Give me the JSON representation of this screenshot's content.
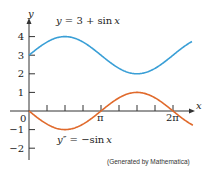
{
  "chart_data": {
    "type": "line",
    "title": "",
    "xlabel": "x",
    "ylabel": "y",
    "xlim": [
      0,
      7.11
    ],
    "ylim": [
      -2.5,
      4.6
    ],
    "grid": false,
    "x_ticks": [
      {
        "value": 0.7854,
        "label": ""
      },
      {
        "value": 1.5708,
        "label": ""
      },
      {
        "value": 2.3562,
        "label": ""
      },
      {
        "value": 3.1416,
        "label": "π"
      },
      {
        "value": 3.927,
        "label": ""
      },
      {
        "value": 4.7124,
        "label": ""
      },
      {
        "value": 5.4978,
        "label": ""
      },
      {
        "value": 6.2832,
        "label": "2π"
      }
    ],
    "y_ticks": [
      {
        "value": 4,
        "label": "4"
      },
      {
        "value": 3,
        "label": "3"
      },
      {
        "value": 2,
        "label": "2"
      },
      {
        "value": 1,
        "label": "1"
      },
      {
        "value": -1,
        "label": "−1"
      },
      {
        "value": -2,
        "label": "−2"
      }
    ],
    "origin_label": "0",
    "series": [
      {
        "name": "y = 3 + sin x",
        "function": "3 + sin(x)",
        "color": "#3a9fd6",
        "x_range": [
          0,
          7.11
        ]
      },
      {
        "name": "y″ = −sin x",
        "function": "-sin(x)",
        "color": "#e06a2c",
        "x_range": [
          0,
          7.15
        ]
      }
    ],
    "annotations": [
      {
        "text": "y = 3 + sin x",
        "attached_to": "blue"
      },
      {
        "text": "y″ = −sin x",
        "attached_to": "orange"
      },
      {
        "text": "(Generated by Mathematica)",
        "position": "bottom-right"
      }
    ]
  },
  "labels": {
    "curve1": {
      "y": "y",
      "eq": " = 3 + sin",
      "x": "x"
    },
    "curve2": {
      "y": "y″",
      "eq": " = −sin",
      "x": "x"
    },
    "credit": "(Generated by Mathematica)",
    "x_axis": "x",
    "y_axis": "y",
    "origin": "0",
    "pi": "π",
    "two_pi": "2π"
  },
  "colors": {
    "blue": "#3a9fd6",
    "orange": "#e06a2c",
    "axis": "#333333",
    "text": "#222222"
  }
}
